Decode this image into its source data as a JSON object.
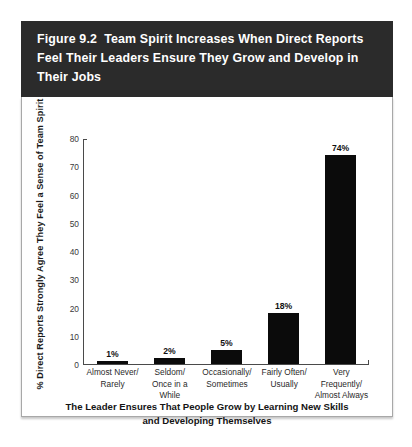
{
  "figure": {
    "title": "Figure 9.2  Team Spirit Increases When Direct Reports\nFeel Their Leaders Ensure They Grow and Develop in\nTheir Jobs",
    "band_color": "#2b2b2b",
    "bar_color": "#0b0b0b",
    "panel_background": "#ffffff"
  },
  "chart_data": {
    "type": "bar",
    "title": "Figure 9.2  Team Spirit Increases When Direct Reports Feel Their Leaders Ensure They Grow and Develop in Their Jobs",
    "categories": [
      "Almost Never/\nRarely",
      "Seldom/\nOnce in a While",
      "Occasionally/\nSometimes",
      "Fairly Often/\nUsually",
      "Very Frequently/\nAlmost Always"
    ],
    "values": [
      1,
      2,
      5,
      18,
      74
    ],
    "value_labels": [
      "1%",
      "2%",
      "5%",
      "18%",
      "74%"
    ],
    "xlabel": "The Leader Ensures That People Grow by Learning New Skills\nand Developing Themselves",
    "ylabel": "% Direct Reports Strongly Agree They Feel\na Sense of Team Spirit",
    "ylim": [
      0,
      80
    ],
    "yticks": [
      80,
      70,
      60,
      50,
      40,
      30,
      20,
      10,
      0
    ],
    "ytick_labels": [
      "80",
      "70",
      "60",
      "50",
      "40",
      "30",
      "20",
      "10",
      "0"
    ],
    "grid": false,
    "legend": false
  }
}
